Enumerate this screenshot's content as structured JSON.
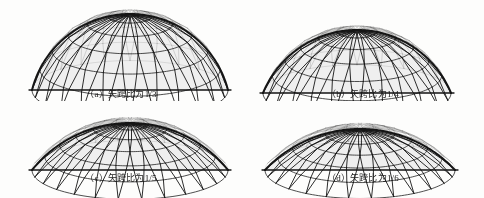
{
  "figure": {
    "background_color": "#fdfdfc",
    "line_color": "#151515",
    "fill_color": "#efefef",
    "panels": [
      {
        "id": "a",
        "caption": "（a）矢跨比为1/3",
        "label": "(a)",
        "ratio_text": "1/3",
        "rise_span_ratio": 0.3333,
        "span_px": 196,
        "rise_px": 76,
        "base_y": 88,
        "left_x": 32,
        "meridians": 24,
        "rings": 6
      },
      {
        "id": "b",
        "caption": "（b）矢跨比为1/4",
        "label": "(b)",
        "ratio_text": "1/4",
        "rise_span_ratio": 0.25,
        "span_px": 188,
        "rise_px": 63,
        "base_y": 91,
        "left_x": 21,
        "meridians": 24,
        "rings": 6
      },
      {
        "id": "c",
        "caption": "（c）矢跨比为1/5",
        "label": "(c)",
        "ratio_text": "1/5",
        "rise_span_ratio": 0.2,
        "span_px": 196,
        "rise_px": 47,
        "base_y": 69,
        "left_x": 32,
        "meridians": 26,
        "rings": 6
      },
      {
        "id": "d",
        "caption": "（d）矢跨比为1/6",
        "label": "(d)",
        "ratio_text": "1/6",
        "rise_span_ratio": 0.1667,
        "span_px": 190,
        "rise_px": 41,
        "base_y": 69,
        "left_x": 23,
        "meridians": 26,
        "rings": 6
      }
    ]
  }
}
